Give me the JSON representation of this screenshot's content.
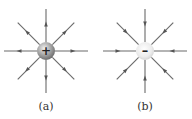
{
  "figures": [
    {
      "id": "a",
      "label": "(a)",
      "charge_sign": "+",
      "charge_type": "positive",
      "field_direction": "outward",
      "line_count": 8,
      "charge_color": "#9a9a9a"
    },
    {
      "id": "b",
      "label": "(b)",
      "charge_sign": "–",
      "charge_type": "negative",
      "field_direction": "inward",
      "line_count": 8,
      "charge_color": "#e8e8e8"
    }
  ],
  "colors": {
    "line": "#6a6a6a",
    "arrow": "#555555",
    "sign": "#222222"
  }
}
